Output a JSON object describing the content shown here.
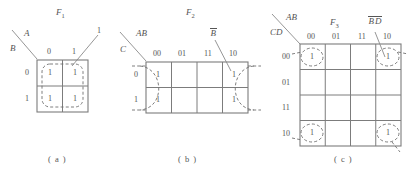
{
  "figure": {
    "caption_a": "( a )",
    "caption_b": "( b )",
    "caption_c": "( c )"
  },
  "map_a": {
    "title": "F",
    "title_sub": "1",
    "row_var": "B",
    "col_var": "A",
    "col_headers": [
      "0",
      "1"
    ],
    "row_headers": [
      "0",
      "1"
    ],
    "cells": [
      [
        "1",
        "1"
      ],
      [
        "1",
        "1"
      ]
    ],
    "annotation": "1"
  },
  "map_b": {
    "title": "F",
    "title_sub": "2",
    "row_var": "C",
    "col_var": "AB",
    "col_headers": [
      "00",
      "01",
      "11",
      "10"
    ],
    "row_headers": [
      "0",
      "1"
    ],
    "cells": [
      [
        "1",
        "",
        "",
        "1"
      ],
      [
        "1",
        "",
        "",
        "1"
      ]
    ],
    "annotation": "B"
  },
  "map_c": {
    "title": "F",
    "title_sub": "3",
    "row_var": "CD",
    "col_var": "AB",
    "col_headers": [
      "00",
      "01",
      "11",
      "10"
    ],
    "row_headers": [
      "00",
      "01",
      "11",
      "10"
    ],
    "cells": [
      [
        "1",
        "",
        "",
        "1"
      ],
      [
        "",
        "",
        "",
        ""
      ],
      [
        "",
        "",
        "",
        ""
      ],
      [
        "1",
        "",
        "",
        "1"
      ]
    ],
    "annotation_b": "B",
    "annotation_d": "D"
  }
}
